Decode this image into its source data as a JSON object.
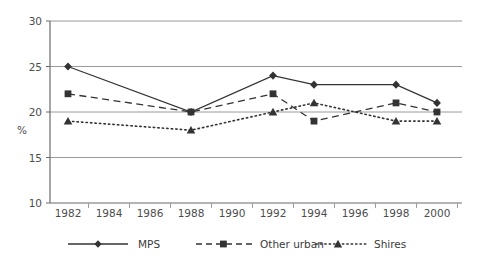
{
  "chart_data": {
    "type": "line",
    "title": "",
    "xlabel": "",
    "ylabel": "%",
    "categories": [
      "1982",
      "1984",
      "1986",
      "1988",
      "1990",
      "1992",
      "1994",
      "1996",
      "1998",
      "2000"
    ],
    "xticklabels": [
      "1982",
      "1984",
      "1986",
      "1988",
      "1990",
      "1992",
      "1994",
      "1996",
      "1998",
      "2000"
    ],
    "yticklabels": [
      "10",
      "15",
      "20",
      "25",
      "30"
    ],
    "yticks": [
      10,
      15,
      20,
      25,
      30
    ],
    "ylim": [
      10,
      30
    ],
    "grid": "horizontal",
    "legend_position": "bottom",
    "series": [
      {
        "name": "MPS",
        "marker": "diamond",
        "linestyle": "solid",
        "color": "#333333",
        "x": [
          "1982",
          "1988",
          "1992",
          "1994",
          "1998",
          "2000"
        ],
        "values": [
          25,
          20,
          24,
          23,
          23,
          21
        ]
      },
      {
        "name": "Other urban",
        "marker": "square",
        "linestyle": "dashed",
        "color": "#333333",
        "x": [
          "1982",
          "1988",
          "1992",
          "1994",
          "1998",
          "2000"
        ],
        "values": [
          22,
          20,
          22,
          19,
          21,
          20
        ]
      },
      {
        "name": "Shires",
        "marker": "triangle",
        "linestyle": "dotted",
        "color": "#333333",
        "x": [
          "1982",
          "1988",
          "1992",
          "1994",
          "1998",
          "2000"
        ],
        "values": [
          19,
          18,
          20,
          21,
          19,
          19
        ]
      }
    ]
  },
  "axis": {
    "y_title": "%",
    "y_labels": {
      "t30": "30",
      "t25": "25",
      "t20": "20",
      "t15": "15",
      "t10": "10"
    },
    "x_labels": {
      "y1982": "1982",
      "y1984": "1984",
      "y1986": "1986",
      "y1988": "1988",
      "y1990": "1990",
      "y1992": "1992",
      "y1994": "1994",
      "y1996": "1996",
      "y1998": "1998",
      "y2000": "2000"
    }
  },
  "legend": {
    "items": [
      {
        "label": "MPS"
      },
      {
        "label": "Other urban"
      },
      {
        "label": "Shires"
      }
    ]
  },
  "colors": {
    "line": "#333333",
    "grid": "#9a9a9a",
    "axis": "#6b6b6b",
    "text": "#4d4d4d",
    "background": "#ffffff"
  }
}
